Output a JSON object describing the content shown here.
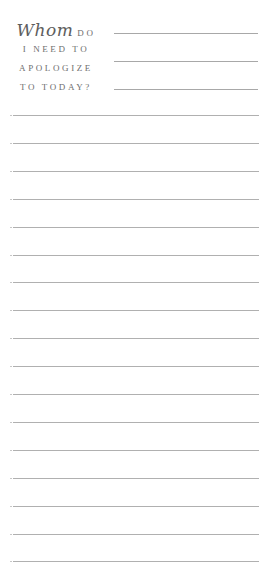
{
  "header": {
    "script_word": "Whom",
    "line1_rest": "DO",
    "line2": "I NEED TO",
    "line3": "APOLOGIZE",
    "line4": "TO TODAY?"
  },
  "header_lines": 3,
  "body_lines": 17,
  "colors": {
    "text": "#6e6e6e",
    "rule": "#b0b0b0",
    "background": "#ffffff"
  }
}
